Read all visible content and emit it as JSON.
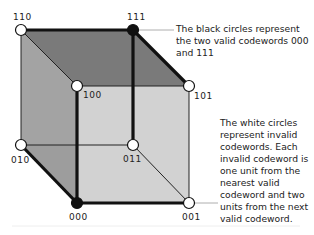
{
  "diagram": {
    "type": "3-bit repetition code cube",
    "vertices": [
      {
        "id": "110",
        "label": "110",
        "valid": false
      },
      {
        "id": "111",
        "label": "111",
        "valid": true
      },
      {
        "id": "100",
        "label": "100",
        "valid": false
      },
      {
        "id": "101",
        "label": "101",
        "valid": false
      },
      {
        "id": "010",
        "label": "010",
        "valid": false
      },
      {
        "id": "011",
        "label": "011",
        "valid": false
      },
      {
        "id": "000",
        "label": "000",
        "valid": true
      },
      {
        "id": "001",
        "label": "001",
        "valid": false
      }
    ],
    "annotations": {
      "valid_note": "The black circles represent the two valid codewords 000 and 111",
      "invalid_note": "The white circles represent invalid codewords. Each invalid codeword is one unit from the nearest valid codeword and two units from the next valid codeword."
    },
    "colors": {
      "top_face": "#7a7a7a",
      "left_face": "#a3a3a3",
      "front_face": "#d2d2d2",
      "edge": "#111111",
      "valid_node": "#111111",
      "invalid_node": "#ffffff"
    }
  }
}
